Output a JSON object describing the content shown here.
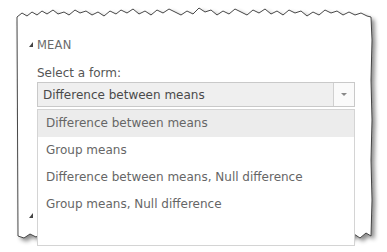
{
  "section": {
    "title": "MEAN",
    "icon": "collapse-triangle-icon"
  },
  "form_select": {
    "label": "Select a form:",
    "value": "Difference between means",
    "arrow_icon": "chevron-down-icon"
  },
  "dropdown": {
    "options": [
      {
        "label": "Difference between means",
        "highlighted": true
      },
      {
        "label": "Group means",
        "highlighted": false
      },
      {
        "label": "Difference between means, Null difference",
        "highlighted": false
      },
      {
        "label": "Group means, Null difference",
        "highlighted": false
      }
    ]
  },
  "colors": {
    "highlight": "#ececec",
    "select_bg": "#efefef",
    "text": "#666666"
  }
}
